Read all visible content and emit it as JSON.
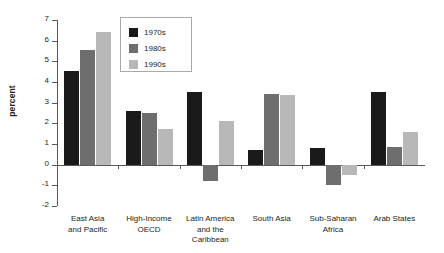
{
  "chart_data": {
    "type": "bar",
    "title": "",
    "xlabel": "",
    "ylabel": "percent",
    "ylim": [
      -2,
      7
    ],
    "yticks": [
      -2,
      -1,
      0,
      1,
      2,
      3,
      4,
      5,
      6,
      7
    ],
    "ytick_labels": [
      "-2",
      "-1",
      "0",
      "1",
      "2",
      "3",
      "4",
      "5",
      "6",
      "7"
    ],
    "grid": false,
    "legend_position": "top-center-left",
    "categories": [
      "East Asia and Pacific",
      "High-Income OECD",
      "Latin America and the Caribbean",
      "South Asia",
      "Sub-Saharan Africa",
      "Arab States"
    ],
    "category_lines": [
      [
        "East Asia",
        "and Pacific"
      ],
      [
        "High-Income",
        "OECD"
      ],
      [
        "Latin America",
        "and the",
        "Caribbean"
      ],
      [
        "South Asia"
      ],
      [
        "Sub-Saharan",
        "Africa"
      ],
      [
        "Arab States"
      ]
    ],
    "series": [
      {
        "name": "1970s",
        "color": "#1a1a1a",
        "values": [
          4.55,
          2.6,
          3.5,
          0.7,
          0.8,
          3.5
        ]
      },
      {
        "name": "1980s",
        "color": "#6e6e6e",
        "values": [
          5.55,
          2.5,
          -0.8,
          3.4,
          -1.0,
          0.85
        ]
      },
      {
        "name": "1990s",
        "color": "#b8b8b8",
        "values": [
          6.4,
          1.75,
          2.1,
          3.35,
          -0.5,
          1.6
        ]
      }
    ]
  }
}
